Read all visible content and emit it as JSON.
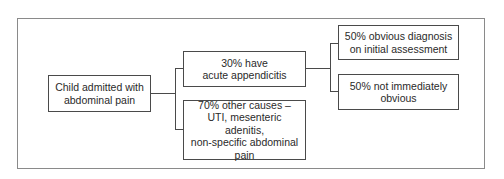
{
  "diagram": {
    "type": "tree-flowchart",
    "root": {
      "label": "Child admitted with abdominal pain",
      "lines": [
        "Child admitted with",
        "abdominal pain"
      ]
    },
    "level1": [
      {
        "label": "30% have acute appendicitis",
        "lines": [
          "30% have",
          "acute appendicitis"
        ]
      },
      {
        "label": "70% other causes – UTI, mesenteric adenitis, non-specific abdominal pain",
        "lines": [
          "70% other causes –",
          "UTI, mesenteric adenitis,",
          "non-specific abdominal",
          "pain"
        ]
      }
    ],
    "level2": [
      {
        "parent": "30% have acute appendicitis",
        "label": "50% obvious diagnosis on initial assessment",
        "lines": [
          "50% obvious diagnosis",
          "on initial assessment"
        ]
      },
      {
        "parent": "30% have acute appendicitis",
        "label": "50% not immediately obvious",
        "lines": [
          "50% not immediately",
          "obvious"
        ]
      }
    ],
    "colors": {
      "box_border": "#4a4a4a",
      "frame_border": "#8a8a8a",
      "text": "#2a2a2a",
      "background": "#ffffff"
    }
  }
}
